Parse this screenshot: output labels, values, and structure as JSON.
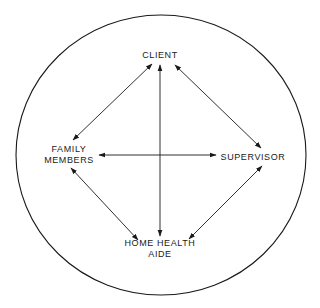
{
  "diagram": {
    "type": "relationship-circle",
    "colors": {
      "stroke": "#1a1a1a",
      "background": "#ffffff"
    },
    "nodes": {
      "client": {
        "lines": [
          "CLIENT"
        ]
      },
      "family": {
        "lines": [
          "FAMILY",
          "MEMBERS"
        ]
      },
      "supervisor": {
        "lines": [
          "SUPERVISOR"
        ]
      },
      "aide": {
        "lines": [
          "HOME HEALTH",
          "AIDE"
        ]
      }
    },
    "edges": [
      {
        "from": "CLIENT",
        "to": "FAMILY MEMBERS",
        "bidirectional": true
      },
      {
        "from": "CLIENT",
        "to": "HOME HEALTH AIDE",
        "bidirectional": true
      },
      {
        "from": "CLIENT",
        "to": "SUPERVISOR",
        "bidirectional": true
      },
      {
        "from": "FAMILY MEMBERS",
        "to": "SUPERVISOR",
        "bidirectional": true
      },
      {
        "from": "FAMILY MEMBERS",
        "to": "HOME HEALTH AIDE",
        "bidirectional": true
      },
      {
        "from": "SUPERVISOR",
        "to": "HOME HEALTH AIDE",
        "bidirectional": true
      }
    ]
  }
}
